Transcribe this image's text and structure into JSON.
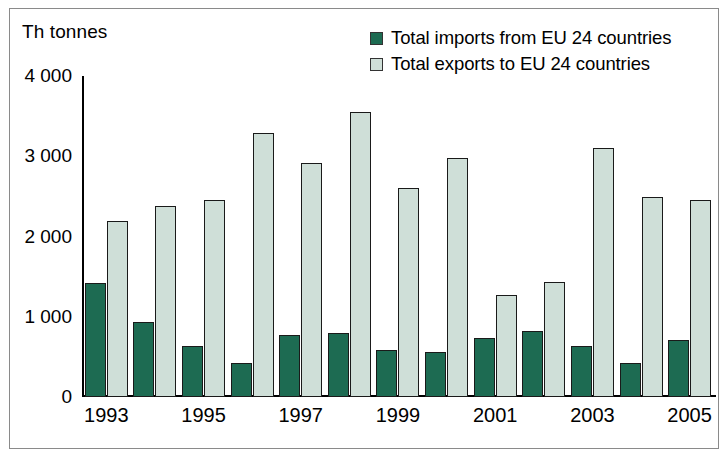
{
  "chart_data": {
    "type": "bar",
    "title": "",
    "ylabel": "Th tonnes",
    "xlabel": "",
    "ylim": [
      0,
      4000
    ],
    "ytick_values": [
      4000,
      3000,
      2000,
      1000,
      0
    ],
    "ytick_labels": [
      "4 000",
      "3 000",
      "2 000",
      "1 000",
      "0"
    ],
    "grid": false,
    "legend_position": "top-right",
    "categories": [
      "1993",
      "1994",
      "1995",
      "1996",
      "1997",
      "1998",
      "1999",
      "2000",
      "2001",
      "2002",
      "2003",
      "2004",
      "2005"
    ],
    "xtick_labels": [
      "1993",
      "",
      "1995",
      "",
      "1997",
      "",
      "1999",
      "",
      "2001",
      "",
      "2003",
      "",
      "2005"
    ],
    "series": [
      {
        "name": "Total imports from EU 24 countries",
        "color": "#1d6b52",
        "values": [
          1420,
          930,
          640,
          430,
          770,
          800,
          590,
          560,
          740,
          820,
          640,
          430,
          710
        ]
      },
      {
        "name": "Total exports to EU 24 countries",
        "color": "#cfdfd8",
        "values": [
          2190,
          2380,
          2450,
          3290,
          2910,
          3550,
          2600,
          2980,
          1270,
          1430,
          3100,
          2490,
          2450
        ]
      }
    ]
  }
}
